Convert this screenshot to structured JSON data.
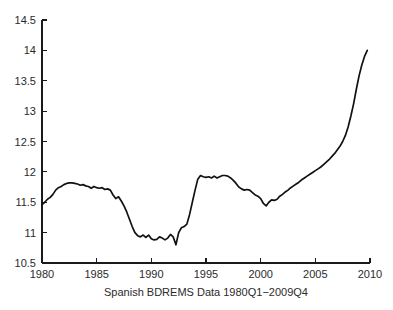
{
  "figure": {
    "background_color": "#ffffff",
    "line_color": "#111111",
    "axis_color": "#1a1a1a",
    "text_color": "#2b2b2b"
  },
  "caption": "Spanish BDREMS Data 1980Q1−2009Q4",
  "chart_data": {
    "type": "line",
    "title": "",
    "subtitle": "",
    "xlabel": "Spanish BDREMS Data 1980Q1−2009Q4",
    "ylabel": "",
    "xlim": [
      1980,
      2010
    ],
    "ylim": [
      10.5,
      14.5
    ],
    "grid": false,
    "legend": null,
    "legend_position": "none",
    "x_tick_labels": [
      "1980",
      "1985",
      "1990",
      "1995",
      "2000",
      "2005",
      "2010"
    ],
    "x_ticks": [
      1980,
      1985,
      1990,
      1995,
      2000,
      2005,
      2010
    ],
    "y_tick_labels": [
      "10.5",
      "11",
      "11.5",
      "12",
      "12.5",
      "13",
      "13.5",
      "14",
      "14.5"
    ],
    "y_ticks": [
      10.5,
      11,
      11.5,
      12,
      12.5,
      13,
      13.5,
      14,
      14.5
    ],
    "series": [
      {
        "name": "Spanish BDREMS",
        "x": [
          1980.0,
          1980.25,
          1980.5,
          1980.75,
          1981.0,
          1981.25,
          1981.5,
          1981.75,
          1982.0,
          1982.25,
          1982.5,
          1982.75,
          1983.0,
          1983.25,
          1983.5,
          1983.75,
          1984.0,
          1984.25,
          1984.5,
          1984.75,
          1985.0,
          1985.25,
          1985.5,
          1985.75,
          1986.0,
          1986.25,
          1986.5,
          1986.75,
          1987.0,
          1987.25,
          1987.5,
          1987.75,
          1988.0,
          1988.25,
          1988.5,
          1988.75,
          1989.0,
          1989.25,
          1989.5,
          1989.75,
          1990.0,
          1990.25,
          1990.5,
          1990.75,
          1991.0,
          1991.25,
          1991.5,
          1991.75,
          1992.0,
          1992.25,
          1992.5,
          1992.75,
          1993.0,
          1993.25,
          1993.5,
          1993.75,
          1994.0,
          1994.25,
          1994.5,
          1994.75,
          1995.0,
          1995.25,
          1995.5,
          1995.75,
          1996.0,
          1996.25,
          1996.5,
          1996.75,
          1997.0,
          1997.25,
          1997.5,
          1997.75,
          1998.0,
          1998.25,
          1998.5,
          1998.75,
          1999.0,
          1999.25,
          1999.5,
          1999.75,
          2000.0,
          2000.25,
          2000.5,
          2000.75,
          2001.0,
          2001.25,
          2001.5,
          2001.75,
          2002.0,
          2002.25,
          2002.5,
          2002.75,
          2003.0,
          2003.25,
          2003.5,
          2003.75,
          2004.0,
          2004.25,
          2004.5,
          2004.75,
          2005.0,
          2005.25,
          2005.5,
          2005.75,
          2006.0,
          2006.25,
          2006.5,
          2006.75,
          2007.0,
          2007.25,
          2007.5,
          2007.75,
          2008.0,
          2008.25,
          2008.5,
          2008.75,
          2009.0,
          2009.25,
          2009.5,
          2009.75
        ],
        "values": [
          11.46,
          11.5,
          11.55,
          11.58,
          11.63,
          11.7,
          11.74,
          11.76,
          11.79,
          11.81,
          11.82,
          11.82,
          11.81,
          11.8,
          11.78,
          11.79,
          11.77,
          11.76,
          11.73,
          11.76,
          11.74,
          11.73,
          11.74,
          11.71,
          11.72,
          11.7,
          11.62,
          11.56,
          11.59,
          11.52,
          11.44,
          11.34,
          11.22,
          11.1,
          11.0,
          10.95,
          10.93,
          10.96,
          10.92,
          10.96,
          10.9,
          10.88,
          10.89,
          10.93,
          10.91,
          10.88,
          10.91,
          10.97,
          10.93,
          10.8,
          11.0,
          11.08,
          11.1,
          11.14,
          11.3,
          11.5,
          11.7,
          11.88,
          11.94,
          11.92,
          11.91,
          11.92,
          11.9,
          11.93,
          11.9,
          11.92,
          11.94,
          11.94,
          11.93,
          11.9,
          11.86,
          11.81,
          11.75,
          11.72,
          11.7,
          11.71,
          11.7,
          11.66,
          11.62,
          11.6,
          11.56,
          11.48,
          11.44,
          11.5,
          11.54,
          11.53,
          11.55,
          11.6,
          11.63,
          11.67,
          11.7,
          11.74,
          11.77,
          11.8,
          11.83,
          11.87,
          11.9,
          11.93,
          11.96,
          11.99,
          12.02,
          12.05,
          12.08,
          12.12,
          12.16,
          12.2,
          12.25,
          12.3,
          12.36,
          12.42,
          12.5,
          12.6,
          12.74,
          12.92,
          13.12,
          13.36,
          13.58,
          13.76,
          13.9,
          14.0
        ]
      }
    ]
  },
  "geometry": {
    "plot_left": 42,
    "plot_right": 370,
    "plot_top": 20,
    "plot_bottom": 263
  }
}
